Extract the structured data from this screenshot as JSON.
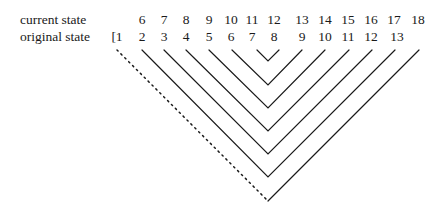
{
  "labels": {
    "current_state": "current state",
    "original_state": "original state"
  },
  "current_state": [
    "6",
    "7",
    "8",
    "9",
    "10",
    "11",
    "12",
    "13",
    "14",
    "15",
    "16",
    "17",
    "18"
  ],
  "original_state": [
    "[1",
    "2",
    "3",
    "4",
    "5",
    "6",
    "7",
    "8",
    "9",
    "10",
    "11",
    "12",
    "13",
    "14]"
  ],
  "diagram": {
    "apex_under": "8",
    "pairs": [
      [
        "7",
        "9"
      ],
      [
        "6",
        "10"
      ],
      [
        "5",
        "11"
      ],
      [
        "4",
        "12"
      ],
      [
        "3",
        "13"
      ],
      [
        "2",
        "14"
      ],
      [
        "1",
        "apex"
      ]
    ],
    "dotted_segment": "1"
  }
}
